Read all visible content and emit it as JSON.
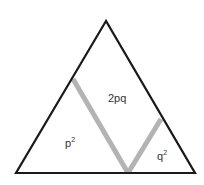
{
  "diagram": {
    "type": "genotype-frequency-triangle",
    "labels": {
      "left_region": "p",
      "left_exp": "2",
      "middle_region": "2pq",
      "right_region": "q",
      "right_exp": "2"
    },
    "colors": {
      "outline": "#1a1a1a",
      "divider": "#b3b3b3",
      "text": "#333333",
      "background": "#ffffff"
    }
  }
}
